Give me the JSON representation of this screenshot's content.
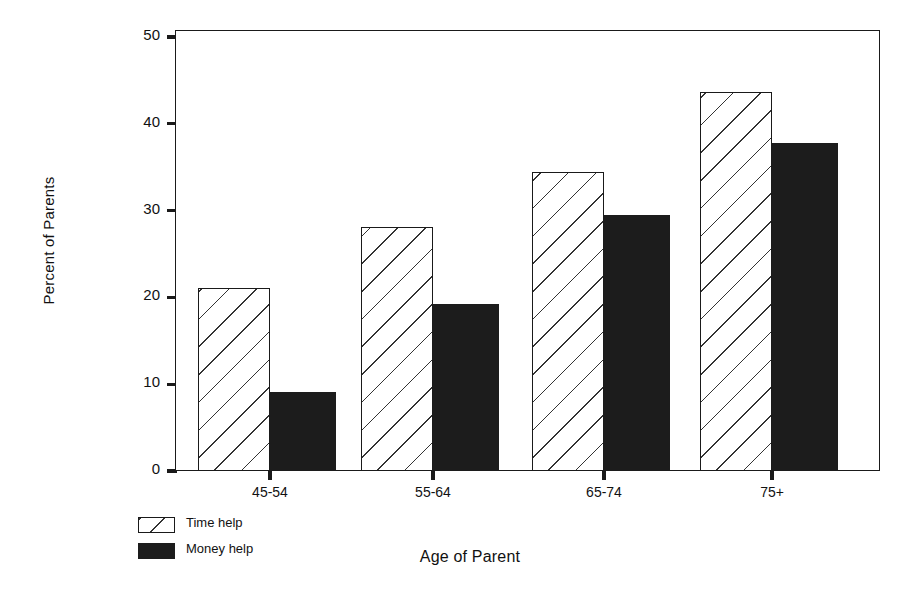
{
  "chart_data": {
    "type": "bar",
    "title": "",
    "subtitle": "",
    "xlabel": "Age of Parent",
    "ylabel": "Percent of Parents",
    "categories": [
      "45-54",
      "55-64",
      "65-74",
      "75+"
    ],
    "series": [
      {
        "name": "Time help",
        "values": [
          21.1,
          28.1,
          34.4,
          43.7
        ],
        "fill": "diagonal-hatch",
        "color": "#ffffff"
      },
      {
        "name": "Money help",
        "values": [
          9.1,
          19.2,
          29.5,
          37.8
        ],
        "fill": "solid",
        "color": "#1c1c1c"
      }
    ],
    "ylim": [
      0,
      50
    ],
    "yticks": [
      0,
      10,
      20,
      30,
      40,
      50
    ],
    "ytick_labels": [
      "0",
      "10",
      "20",
      "30",
      "40",
      "50"
    ],
    "grid": false,
    "legend_position": "below-left",
    "orientation": "vertical",
    "frame": "box"
  },
  "legend": {
    "items": [
      {
        "label": "Time help"
      },
      {
        "label": "Money help"
      }
    ]
  }
}
